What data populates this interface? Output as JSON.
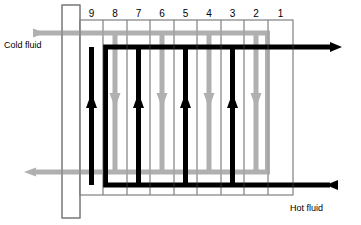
{
  "diagram": {
    "labels": {
      "cold_fluid": "Cold fluid",
      "hot_fluid": "Hot fluid"
    },
    "channel_numbers": [
      "9",
      "8",
      "7",
      "6",
      "5",
      "4",
      "3",
      "2",
      "1"
    ],
    "colors": {
      "hot_stream": "#000000",
      "cold_stream": "#b0b0b0",
      "plate_line": "#808080",
      "frame_outline": "#777777",
      "background": "#ffffff"
    },
    "streams": [
      {
        "name": "cold_fluid",
        "color": "#b0b0b0",
        "inlet_side": "left-top",
        "outlet_side": "left-bottom",
        "direction": "downward",
        "channels": [
          "8",
          "6",
          "4",
          "2"
        ]
      },
      {
        "name": "hot_fluid",
        "color": "#000000",
        "inlet_side": "right-bottom",
        "outlet_side": "right-top",
        "direction": "upward",
        "channels": [
          "9",
          "7",
          "5",
          "3"
        ]
      }
    ],
    "geometry": {
      "frame_plate": {
        "x": 62,
        "y": 5,
        "w": 18,
        "h": 213
      },
      "pack": {
        "x": 80,
        "y": 20,
        "w": 213,
        "h": 175
      },
      "plate_x": [
        80,
        103,
        127,
        150,
        174,
        197,
        221,
        244,
        268,
        293
      ],
      "cold_top_y": 33,
      "cold_bottom_y": 172,
      "hot_top_y": 47,
      "hot_bottom_y": 185
    }
  }
}
